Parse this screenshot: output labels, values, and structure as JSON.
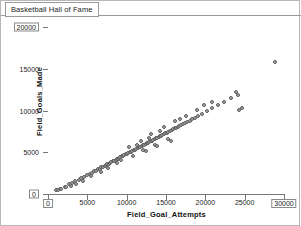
{
  "window": {
    "title": "Basketball Hall of Fame"
  },
  "chart_data": {
    "type": "scatter",
    "title": "Basketball Hall of Fame",
    "xlabel": "Field_Goal_Attempts",
    "ylabel": "Field_Goals_Made",
    "xlim": [
      0,
      30000
    ],
    "ylim": [
      0,
      20000
    ],
    "xticks": [
      0,
      5000,
      10000,
      15000,
      20000,
      25000,
      30000
    ],
    "yticks": [
      0,
      5000,
      10000,
      15000,
      20000
    ],
    "xtick_labels": [
      "0",
      "5000",
      "10000",
      "15000",
      "20000",
      "25000",
      "30000"
    ],
    "ytick_labels": [
      "0",
      "5000",
      "10000",
      "15000",
      "20000"
    ],
    "grid": false,
    "legend": null,
    "marker": {
      "shape": "circle",
      "fill": "#a6a6a6",
      "edge": "#5e5e5e",
      "size": 4
    },
    "boxed_tick_labels": {
      "x": [
        "0",
        "30000"
      ],
      "y": [
        "0",
        "20000"
      ]
    },
    "points": [
      [
        1050,
        420
      ],
      [
        1500,
        610
      ],
      [
        2100,
        880
      ],
      [
        2650,
        1150
      ],
      [
        3100,
        1320
      ],
      [
        3450,
        1500
      ],
      [
        3900,
        1720
      ],
      [
        4250,
        1880
      ],
      [
        4600,
        2050
      ],
      [
        5000,
        2250
      ],
      [
        5300,
        2400
      ],
      [
        5600,
        2550
      ],
      [
        5900,
        2700
      ],
      [
        6100,
        2800
      ],
      [
        6350,
        2950
      ],
      [
        6600,
        3050
      ],
      [
        6800,
        3180
      ],
      [
        7000,
        3280
      ],
      [
        7200,
        3380
      ],
      [
        7350,
        3460
      ],
      [
        7550,
        3560
      ],
      [
        7700,
        3640
      ],
      [
        7900,
        3740
      ],
      [
        8050,
        3820
      ],
      [
        8250,
        3920
      ],
      [
        8400,
        4000
      ],
      [
        8600,
        4100
      ],
      [
        8750,
        4180
      ],
      [
        8900,
        4250
      ],
      [
        9050,
        4330
      ],
      [
        9200,
        4400
      ],
      [
        9400,
        4500
      ],
      [
        9550,
        4580
      ],
      [
        9700,
        4650
      ],
      [
        9900,
        4750
      ],
      [
        10050,
        4820
      ],
      [
        10200,
        4900
      ],
      [
        10400,
        5000
      ],
      [
        10550,
        5080
      ],
      [
        10700,
        5150
      ],
      [
        10900,
        5250
      ],
      [
        11050,
        5320
      ],
      [
        11200,
        5400
      ],
      [
        11400,
        5500
      ],
      [
        11550,
        5580
      ],
      [
        11700,
        5650
      ],
      [
        11900,
        5750
      ],
      [
        12050,
        5820
      ],
      [
        12200,
        5900
      ],
      [
        12400,
        6000
      ],
      [
        12550,
        6080
      ],
      [
        12700,
        6150
      ],
      [
        12900,
        6250
      ],
      [
        13050,
        6320
      ],
      [
        13200,
        6400
      ],
      [
        13400,
        6500
      ],
      [
        13550,
        6580
      ],
      [
        13700,
        6650
      ],
      [
        13900,
        6750
      ],
      [
        14050,
        6820
      ],
      [
        14200,
        6900
      ],
      [
        14400,
        7000
      ],
      [
        14550,
        7080
      ],
      [
        14700,
        7150
      ],
      [
        14900,
        7250
      ],
      [
        15100,
        7350
      ],
      [
        15300,
        7450
      ],
      [
        15500,
        7550
      ],
      [
        15700,
        7650
      ],
      [
        15900,
        7750
      ],
      [
        16100,
        7850
      ],
      [
        16300,
        7950
      ],
      [
        16500,
        8050
      ],
      [
        16700,
        8150
      ],
      [
        16900,
        8250
      ],
      [
        17100,
        8350
      ],
      [
        17400,
        8500
      ],
      [
        17700,
        8650
      ],
      [
        18000,
        8800
      ],
      [
        18300,
        8950
      ],
      [
        18700,
        9150
      ],
      [
        19100,
        9350
      ],
      [
        19600,
        9600
      ],
      [
        20200,
        9900
      ],
      [
        20900,
        10250
      ],
      [
        21600,
        10600
      ],
      [
        22400,
        11000
      ],
      [
        23300,
        11450
      ],
      [
        24200,
        11900
      ],
      [
        24300,
        10050
      ],
      [
        24600,
        10350
      ],
      [
        23900,
        12200
      ],
      [
        20800,
        11000
      ],
      [
        28800,
        15800
      ],
      [
        9300,
        4100
      ],
      [
        10800,
        4600
      ],
      [
        12100,
        5300
      ],
      [
        13600,
        5900
      ],
      [
        15200,
        6600
      ],
      [
        11300,
        5900
      ],
      [
        12800,
        6700
      ],
      [
        14300,
        7500
      ],
      [
        16800,
        9000
      ],
      [
        18900,
        10100
      ],
      [
        7600,
        3100
      ],
      [
        8800,
        3700
      ],
      [
        6700,
        2600
      ],
      [
        5500,
        2100
      ],
      [
        4400,
        1600
      ],
      [
        3600,
        1250
      ],
      [
        2900,
        1000
      ],
      [
        2300,
        780
      ],
      [
        1700,
        560
      ],
      [
        1250,
        450
      ],
      [
        13100,
        7200
      ],
      [
        14700,
        8000
      ],
      [
        16200,
        8700
      ],
      [
        17600,
        9400
      ],
      [
        19800,
        10700
      ],
      [
        10300,
        5600
      ],
      [
        11800,
        6300
      ],
      [
        12400,
        5100
      ],
      [
        13900,
        5800
      ],
      [
        15600,
        6400
      ]
    ]
  }
}
